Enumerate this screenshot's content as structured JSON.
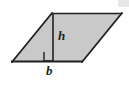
{
  "figure": {
    "type": "geometry-diagram",
    "shape_name": "parallelogram",
    "background_color": "#ffffff",
    "fill_color": "#c9c9c9",
    "stroke_color": "#231f20",
    "edge_highlight_color": "#e2e2e2",
    "labels": {
      "height": "h",
      "base": "b"
    },
    "vertices": {
      "bottom_left": [
        12,
        62
      ],
      "top_left": [
        52,
        13
      ],
      "top_right": [
        122,
        13
      ],
      "bottom_right": [
        82,
        62
      ]
    },
    "height_segment": {
      "x": 53,
      "y_top": 13,
      "y_bottom": 62
    },
    "right_angle_marker": {
      "x": 44,
      "y": 52,
      "width": 9,
      "height": 10
    },
    "label_positions": {
      "height_label": [
        58,
        40
      ],
      "base_label": [
        47,
        74
      ]
    }
  }
}
